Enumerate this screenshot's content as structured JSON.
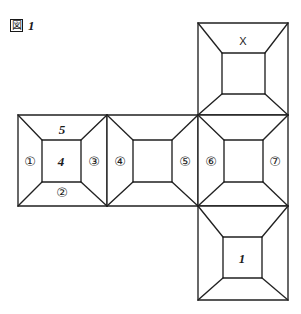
{
  "figure": {
    "caption_marker": "図",
    "caption_marker_name": "boxed-figure-glyph",
    "caption_number": "1",
    "stroke_color": "#212121",
    "background_color": "#ffffff"
  },
  "panels": {
    "top": {
      "name": "panel-top",
      "position": "above-right-strip-panel",
      "labels": {
        "upper_trapezoid": "X"
      }
    },
    "strip_left": {
      "name": "panel-strip-left",
      "labels": {
        "left_trapezoid": "①",
        "upper_trapezoid": "5",
        "inner_square": "4",
        "right_trapezoid": "③",
        "lower_trapezoid": "②"
      }
    },
    "strip_middle": {
      "name": "panel-strip-middle",
      "labels": {
        "left_trapezoid": "④",
        "right_trapezoid": "⑤"
      }
    },
    "strip_right": {
      "name": "panel-strip-right",
      "labels": {
        "left_trapezoid": "⑥",
        "right_trapezoid": "⑦"
      }
    },
    "bottom": {
      "name": "panel-bottom",
      "position": "below-right-strip-panel",
      "labels": {
        "inner_square": "1"
      }
    }
  },
  "labels_flat": {
    "c1": "①",
    "c2": "②",
    "c3": "③",
    "c4": "④",
    "c5": "⑤",
    "c6": "⑥",
    "c7": "⑦",
    "n5": "5",
    "n4": "4",
    "n1": "1",
    "x": "X"
  }
}
